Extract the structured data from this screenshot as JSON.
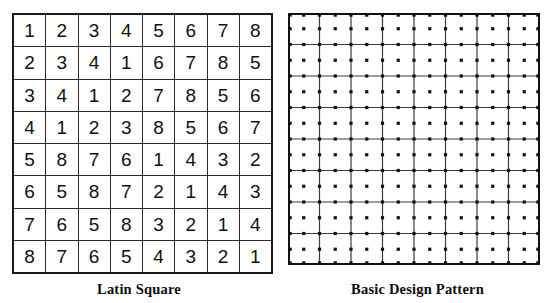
{
  "figure": {
    "background_color": "#ffffff",
    "ink_color": "#111111"
  },
  "panels": {
    "latin_square": {
      "caption": "Latin Square",
      "grid_size": 8,
      "border_color": "#1a1a1a",
      "cell_border_color": "#2b2b2b",
      "rows": [
        [
          1,
          2,
          3,
          4,
          5,
          6,
          7,
          8
        ],
        [
          2,
          3,
          4,
          1,
          6,
          7,
          8,
          5
        ],
        [
          3,
          4,
          1,
          2,
          7,
          8,
          5,
          6
        ],
        [
          4,
          1,
          2,
          3,
          8,
          5,
          6,
          7
        ],
        [
          5,
          8,
          7,
          6,
          1,
          4,
          3,
          2
        ],
        [
          6,
          5,
          8,
          7,
          2,
          1,
          4,
          3
        ],
        [
          7,
          6,
          5,
          8,
          3,
          2,
          1,
          4
        ],
        [
          8,
          7,
          6,
          5,
          4,
          3,
          2,
          1
        ]
      ]
    },
    "design_pattern": {
      "caption": "Basic Design Pattern",
      "grid_size": 8,
      "dot_lattice_size": 17,
      "dot_color": "#111111",
      "line_color": "#3c3c3c",
      "outer_border_color": "#111111",
      "dot_radius": 1.6,
      "description": "8 by 8 cell grid overlaid on a 17 by 17 square dot lattice, dots at every half-cell position"
    }
  }
}
